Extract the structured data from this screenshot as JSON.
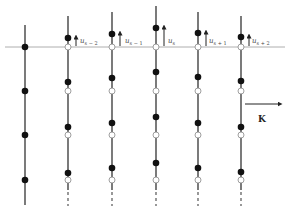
{
  "diagram": {
    "type": "lattice-chain-displacement",
    "horizontal_line_y": 47,
    "wave_vector_label": "K",
    "chains": [
      {
        "x": 25,
        "top": 25,
        "filled": [
          47,
          91,
          135,
          180
        ],
        "open": [],
        "label": null,
        "arrow_len": 0
      },
      {
        "x": 68,
        "top": 16,
        "filled": [
          38,
          82,
          127,
          173
        ],
        "open": [
          47,
          91,
          135,
          180
        ],
        "label_base": "u",
        "label_sub": "s − 2",
        "arrow_len": 9
      },
      {
        "x": 112,
        "top": 12,
        "filled": [
          34,
          78,
          123,
          168
        ],
        "open": [
          47,
          91,
          135,
          180
        ],
        "label_base": "u",
        "label_sub": "s − 1",
        "arrow_len": 13
      },
      {
        "x": 156,
        "top": 6,
        "filled": [
          28,
          72,
          117,
          163
        ],
        "open": [
          47,
          91,
          135,
          180
        ],
        "label_base": "u",
        "label_sub": "s",
        "arrow_len": 19
      },
      {
        "x": 198,
        "top": 12,
        "filled": [
          33,
          77,
          123,
          168
        ],
        "open": [
          47,
          91,
          135,
          180
        ],
        "label_base": "u",
        "label_sub": "s + 1",
        "arrow_len": 14
      },
      {
        "x": 241,
        "top": 16,
        "filled": [
          37,
          81,
          127,
          172
        ],
        "open": [
          47,
          91,
          135,
          180
        ],
        "label_base": "u",
        "label_sub": "s + 2",
        "arrow_len": 10
      }
    ],
    "labels": {
      "u_sm2": {
        "base": "u",
        "sub": "s − 2"
      },
      "u_sm1": {
        "base": "u",
        "sub": "s − 1"
      },
      "u_s": {
        "base": "u",
        "sub": "s"
      },
      "u_sp1": {
        "base": "u",
        "sub": "s + 1"
      },
      "u_sp2": {
        "base": "u",
        "sub": "s + 2"
      },
      "k": "K"
    }
  }
}
